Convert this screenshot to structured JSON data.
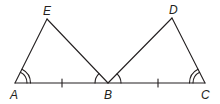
{
  "diagram": {
    "type": "geometry",
    "stroke_color": "#231f20",
    "points": {
      "A": {
        "label": "A",
        "x": 15,
        "y": 83
      },
      "B": {
        "label": "B",
        "x": 108,
        "y": 83
      },
      "C": {
        "label": "C",
        "x": 205,
        "y": 83
      },
      "E": {
        "label": "E",
        "x": 47,
        "y": 19
      },
      "D": {
        "label": "D",
        "x": 172,
        "y": 18
      }
    },
    "segments": [
      "AC",
      "AE",
      "EB",
      "BD",
      "DC"
    ],
    "tick_marks": [
      "AB",
      "BC"
    ],
    "angle_marks": [
      {
        "vertex": "A",
        "arcs": 2
      },
      {
        "vertex": "C",
        "arcs": 2
      },
      {
        "vertex": "B",
        "side": "EBA",
        "arcs": 1
      },
      {
        "vertex": "B",
        "side": "DBC",
        "arcs": 1
      }
    ]
  }
}
